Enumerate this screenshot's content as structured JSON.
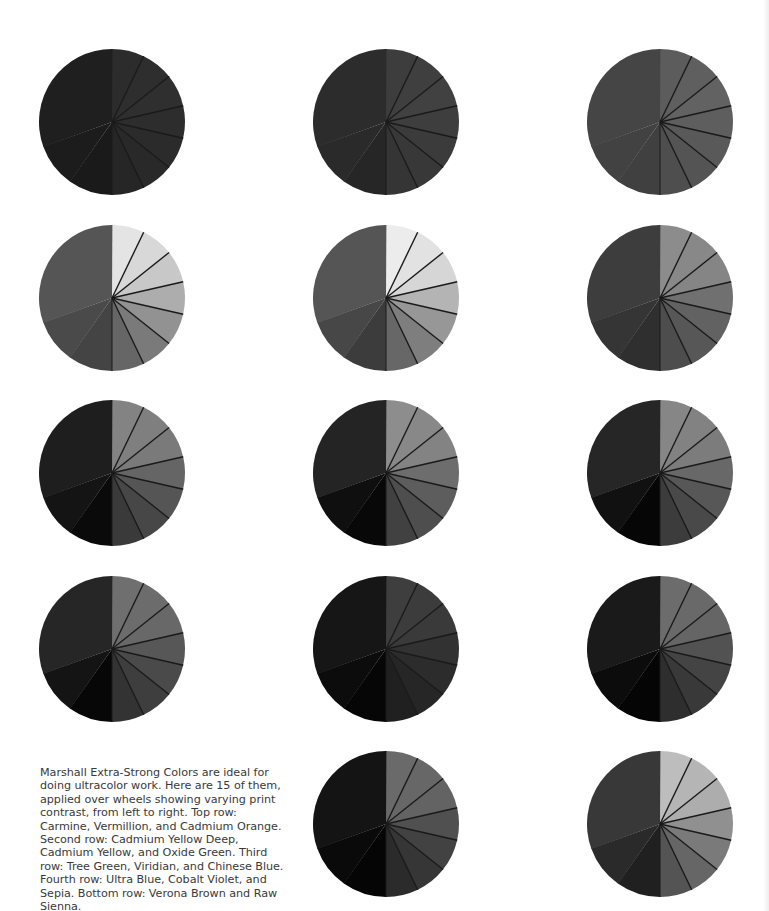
{
  "caption": "Marshall Extra-Strong Colors are ideal for doing ultracolor work. Here are 15 of them, applied over wheels showing varying print contrast, from left to right. Top row: Carmine, Vermillion, and Cadmium Orange. Second row: Cadmium Yellow Deep, Cadmium Yellow, and Oxide Green. Third row: Tree Green, Viridian, and Chinese Blue. Fourth row: Ultra Blue, Cobalt Violet, and Sepia. Bottom row: Verona Brown and Raw Sienna.",
  "layout": {
    "columns_x": [
      38,
      312,
      586
    ],
    "rows_y": [
      48,
      224,
      399,
      575,
      750
    ]
  },
  "wheels": [
    {
      "name": "Carmine",
      "row": 0,
      "col": 0,
      "left": [
        "#1a1a1a",
        "#1c1c1c",
        "#1f1f1f"
      ],
      "right": [
        "#2c2c2c",
        "#2e2e2e",
        "#2f2f2f",
        "#2d2d2d",
        "#2b2b2b",
        "#292929",
        "#262626"
      ]
    },
    {
      "name": "Vermillion",
      "row": 0,
      "col": 1,
      "left": [
        "#262626",
        "#2a2a2a",
        "#2c2c2c"
      ],
      "right": [
        "#3d3d3d",
        "#3f3f3f",
        "#414141",
        "#3e3e3e",
        "#3b3b3b",
        "#383838",
        "#353535"
      ]
    },
    {
      "name": "Cadmium Orange",
      "row": 0,
      "col": 2,
      "left": [
        "#404040",
        "#424242",
        "#454545"
      ],
      "right": [
        "#5c5c5c",
        "#5f5f5f",
        "#626262",
        "#5e5e5e",
        "#595959",
        "#545454",
        "#4e4e4e"
      ]
    },
    {
      "name": "Cadmium Yellow Deep",
      "row": 1,
      "col": 0,
      "left": [
        "#444444",
        "#4a4a4a",
        "#555555"
      ],
      "right": [
        "#e4e4e4",
        "#d8d8d8",
        "#c8c8c8",
        "#adadad",
        "#929292",
        "#7a7a7a",
        "#666666"
      ]
    },
    {
      "name": "Cadmium Yellow",
      "row": 1,
      "col": 1,
      "left": [
        "#3c3c3c",
        "#474747",
        "#555555"
      ],
      "right": [
        "#ececec",
        "#e2e2e2",
        "#d6d6d6",
        "#b4b4b4",
        "#979797",
        "#7e7e7e",
        "#676767"
      ]
    },
    {
      "name": "Oxide Green",
      "row": 1,
      "col": 2,
      "left": [
        "#2f2f2f",
        "#353535",
        "#3d3d3d"
      ],
      "right": [
        "#8c8c8c",
        "#888888",
        "#858585",
        "#707070",
        "#626262",
        "#575757",
        "#4d4d4d"
      ]
    },
    {
      "name": "Tree Green",
      "row": 2,
      "col": 0,
      "left": [
        "#0a0a0a",
        "#141414",
        "#1e1e1e"
      ],
      "right": [
        "#838383",
        "#7f7f7f",
        "#7a7a7a",
        "#656565",
        "#555555",
        "#474747",
        "#3a3a3a"
      ]
    },
    {
      "name": "Viridian",
      "row": 2,
      "col": 1,
      "left": [
        "#080808",
        "#0f0f0f",
        "#242424"
      ],
      "right": [
        "#8d8d8d",
        "#888888",
        "#838383",
        "#6d6d6d",
        "#5d5d5d",
        "#4e4e4e",
        "#414141"
      ]
    },
    {
      "name": "Chinese Blue",
      "row": 2,
      "col": 2,
      "left": [
        "#060606",
        "#111111",
        "#262626"
      ],
      "right": [
        "#868686",
        "#828282",
        "#7c7c7c",
        "#686868",
        "#575757",
        "#494949",
        "#3c3c3c"
      ]
    },
    {
      "name": "Ultra Blue",
      "row": 3,
      "col": 0,
      "left": [
        "#070707",
        "#141414",
        "#262626"
      ],
      "right": [
        "#6f6f6f",
        "#6c6c6c",
        "#686868",
        "#575757",
        "#4a4a4a",
        "#3e3e3e",
        "#333333"
      ]
    },
    {
      "name": "Cobalt Violet",
      "row": 3,
      "col": 1,
      "left": [
        "#060606",
        "#0c0c0c",
        "#161616"
      ],
      "right": [
        "#3e3e3e",
        "#3c3c3c",
        "#3a3a3a",
        "#323232",
        "#2c2c2c",
        "#262626",
        "#202020"
      ]
    },
    {
      "name": "Sepia",
      "row": 3,
      "col": 2,
      "left": [
        "#050505",
        "#0c0c0c",
        "#1a1a1a"
      ],
      "right": [
        "#6c6c6c",
        "#696969",
        "#656565",
        "#525252",
        "#444444",
        "#393939",
        "#2e2e2e"
      ]
    },
    {
      "name": "Verona Brown",
      "row": 4,
      "col": 1,
      "left": [
        "#050505",
        "#0a0a0a",
        "#141414"
      ],
      "right": [
        "#6a6a6a",
        "#676767",
        "#636363",
        "#505050",
        "#424242",
        "#363636",
        "#2b2b2b"
      ]
    },
    {
      "name": "Raw Sienna",
      "row": 4,
      "col": 2,
      "left": [
        "#202020",
        "#2a2a2a",
        "#383838"
      ],
      "right": [
        "#bdbdbd",
        "#b5b5b5",
        "#adadad",
        "#909090",
        "#7a7a7a",
        "#666666",
        "#545454"
      ]
    }
  ],
  "divider_color": "#1a1a1a"
}
